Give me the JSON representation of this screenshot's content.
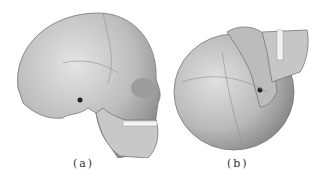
{
  "figure": {
    "panels": [
      {
        "id": "a",
        "label": "(a)",
        "description": "skull lateral view"
      },
      {
        "id": "b",
        "label": "(b)",
        "description": "skull rotated posterior-superior view"
      }
    ]
  }
}
